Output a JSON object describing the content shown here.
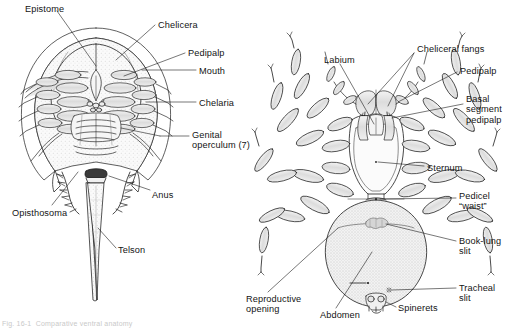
{
  "figure": {
    "kind": "anatomical-diagram",
    "background": "#ffffff",
    "ink": "#1c1c1c",
    "fill_light": "#ebebeb",
    "fill_mid": "#d8d8d8",
    "caption": "Fig. 16-1  Comparative ventral anatomy"
  },
  "panels": {
    "left": {
      "name": "horseshoe-crab-ventral",
      "labels": [
        {
          "id": "epistome",
          "text": "Epistome",
          "x": 25,
          "y": 4,
          "align": "left"
        },
        {
          "id": "chelicera",
          "text": "Chelicera",
          "x": 158,
          "y": 20,
          "align": "left"
        },
        {
          "id": "pedipalp",
          "text": "Pedipalp",
          "x": 188,
          "y": 48,
          "align": "left"
        },
        {
          "id": "mouth",
          "text": "Mouth",
          "x": 199,
          "y": 66,
          "align": "left"
        },
        {
          "id": "chelaria",
          "text": "Chelaria",
          "x": 199,
          "y": 98,
          "align": "left"
        },
        {
          "id": "genital-operculum",
          "text": "Genital\noperculum (7)",
          "x": 192,
          "y": 130,
          "align": "left"
        },
        {
          "id": "anus",
          "text": "Anus",
          "x": 152,
          "y": 190,
          "align": "left"
        },
        {
          "id": "opisthosoma",
          "text": "Opisthosoma",
          "x": 12,
          "y": 208,
          "align": "left"
        },
        {
          "id": "telson",
          "text": "Telson",
          "x": 118,
          "y": 245,
          "align": "left"
        }
      ]
    },
    "right": {
      "name": "spider-ventral",
      "labels": [
        {
          "id": "labium",
          "text": "Labium",
          "x": 324,
          "y": 55,
          "align": "left"
        },
        {
          "id": "cheliceral-fangs",
          "text": "Cheliceral fangs",
          "x": 417,
          "y": 44,
          "align": "left"
        },
        {
          "id": "pedipalp",
          "text": "Pedipalp",
          "x": 460,
          "y": 66,
          "align": "left"
        },
        {
          "id": "basal-segment-pedipalp",
          "text": "Basal\nsegment\npedipalp",
          "x": 466,
          "y": 94,
          "align": "left"
        },
        {
          "id": "sternum",
          "text": "Sternum",
          "x": 427,
          "y": 163,
          "align": "left"
        },
        {
          "id": "pedicel-waist",
          "text": "Pedicel\n“waist”",
          "x": 459,
          "y": 191,
          "align": "left"
        },
        {
          "id": "book-lung-slit",
          "text": "Book-lung\nslit",
          "x": 459,
          "y": 236,
          "align": "left"
        },
        {
          "id": "tracheal-slit",
          "text": "Tracheal\nslit",
          "x": 459,
          "y": 283,
          "align": "left"
        },
        {
          "id": "reproductive-opening",
          "text": "Reproductive\nopening",
          "x": 246,
          "y": 294,
          "align": "left"
        },
        {
          "id": "abdomen",
          "text": "Abdomen",
          "x": 320,
          "y": 310,
          "align": "left"
        },
        {
          "id": "spinerets",
          "text": "Spinerets",
          "x": 398,
          "y": 303,
          "align": "left"
        }
      ]
    }
  }
}
